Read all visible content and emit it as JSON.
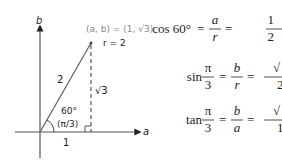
{
  "diagram": {
    "axes": {
      "vertical_label": "b",
      "horizontal_label": "a"
    },
    "point_label": "(a, b) = (1, √3)",
    "radius_label": "r = 2",
    "hypotenuse_label": "2",
    "opposite_label": "√3",
    "adjacent_label": "1",
    "angle_deg_label": "60°",
    "angle_rad_label": "(π/3)",
    "colors": {
      "line": "#555555",
      "text": "#222222",
      "muted": "#888888"
    }
  },
  "equations": [
    {
      "func": "cos 60°",
      "num1": "a",
      "den1": "r",
      "num2": "1",
      "den2": "2"
    },
    {
      "func": "sin",
      "arg_num": "π",
      "arg_den": "3",
      "num1": "b",
      "den1": "r",
      "num2": "√",
      "den2": "2"
    },
    {
      "func": "tan",
      "arg_num": "π",
      "arg_den": "3",
      "num1": "b",
      "den1": "a",
      "num2": "√",
      "den2": "1"
    }
  ],
  "eq_sign": "="
}
